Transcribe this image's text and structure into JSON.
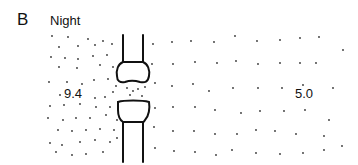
{
  "panel": {
    "letter": "B",
    "title": "Night"
  },
  "regions": {
    "left": {
      "value_label": "9.4",
      "label_x": 64,
      "label_y": 86
    },
    "right": {
      "value_label": "5.0",
      "label_x": 295,
      "label_y": 86
    }
  },
  "colors": {
    "ink": "#111111",
    "dot": "#333333",
    "background": "#ffffff"
  },
  "structure": {
    "upper_process": {
      "left_x": 123,
      "right_x": 143,
      "top_y": 35,
      "bulb_top_y": 62,
      "bulb_bottom_y": 83
    },
    "lower_process": {
      "left_x": 123,
      "right_x": 143,
      "bulb_top_y": 100,
      "bulb_bottom_y": 122,
      "bottom_y": 162
    }
  },
  "dots": {
    "left_dense": [
      [
        52,
        36
      ],
      [
        68,
        37
      ],
      [
        88,
        39
      ],
      [
        103,
        41
      ],
      [
        59,
        47
      ],
      [
        78,
        46
      ],
      [
        95,
        45
      ],
      [
        112,
        44
      ],
      [
        51,
        57
      ],
      [
        65,
        58
      ],
      [
        78,
        59
      ],
      [
        93,
        56
      ],
      [
        107,
        55
      ],
      [
        59,
        67
      ],
      [
        77,
        68
      ],
      [
        100,
        65
      ],
      [
        113,
        67
      ],
      [
        49,
        82
      ],
      [
        67,
        82
      ],
      [
        82,
        84
      ],
      [
        94,
        80
      ],
      [
        108,
        79
      ],
      [
        116,
        86
      ],
      [
        60,
        95
      ],
      [
        95,
        98
      ],
      [
        105,
        97
      ],
      [
        113,
        92
      ],
      [
        50,
        106
      ],
      [
        64,
        105
      ],
      [
        80,
        104
      ],
      [
        96,
        107
      ],
      [
        110,
        107
      ],
      [
        118,
        102
      ],
      [
        48,
        118
      ],
      [
        63,
        120
      ],
      [
        76,
        118
      ],
      [
        90,
        118
      ],
      [
        106,
        115
      ],
      [
        117,
        120
      ],
      [
        58,
        130
      ],
      [
        72,
        131
      ],
      [
        86,
        130
      ],
      [
        100,
        129
      ],
      [
        114,
        130
      ],
      [
        50,
        143
      ],
      [
        62,
        145
      ],
      [
        80,
        142
      ],
      [
        95,
        140
      ],
      [
        110,
        142
      ],
      [
        117,
        138
      ],
      [
        56,
        152
      ],
      [
        72,
        155
      ],
      [
        86,
        154
      ],
      [
        103,
        152
      ],
      [
        127,
        88
      ],
      [
        133,
        91
      ],
      [
        138,
        89
      ],
      [
        145,
        87
      ],
      [
        130,
        95
      ],
      [
        142,
        96
      ]
    ],
    "right_sparse": [
      [
        153,
        44
      ],
      [
        172,
        42
      ],
      [
        191,
        41
      ],
      [
        214,
        42
      ],
      [
        235,
        36
      ],
      [
        257,
        41
      ],
      [
        280,
        40
      ],
      [
        300,
        38
      ],
      [
        319,
        37
      ],
      [
        343,
        50
      ],
      [
        152,
        64
      ],
      [
        173,
        64
      ],
      [
        195,
        62
      ],
      [
        217,
        63
      ],
      [
        236,
        61
      ],
      [
        258,
        64
      ],
      [
        280,
        63
      ],
      [
        300,
        63
      ],
      [
        316,
        63
      ],
      [
        155,
        83
      ],
      [
        172,
        86
      ],
      [
        193,
        84
      ],
      [
        209,
        91
      ],
      [
        233,
        88
      ],
      [
        258,
        88
      ],
      [
        282,
        88
      ],
      [
        303,
        85
      ],
      [
        333,
        88
      ],
      [
        155,
        108
      ],
      [
        173,
        107
      ],
      [
        195,
        107
      ],
      [
        215,
        110
      ],
      [
        241,
        113
      ],
      [
        260,
        111
      ],
      [
        284,
        111
      ],
      [
        305,
        110
      ],
      [
        329,
        120
      ],
      [
        154,
        127
      ],
      [
        173,
        131
      ],
      [
        194,
        131
      ],
      [
        215,
        134
      ],
      [
        237,
        134
      ],
      [
        256,
        130
      ],
      [
        275,
        131
      ],
      [
        296,
        134
      ],
      [
        324,
        136
      ],
      [
        155,
        148
      ],
      [
        174,
        151
      ],
      [
        195,
        152
      ],
      [
        216,
        155
      ],
      [
        232,
        150
      ],
      [
        256,
        153
      ],
      [
        280,
        154
      ],
      [
        303,
        153
      ],
      [
        324,
        150
      ],
      [
        342,
        146
      ]
    ]
  }
}
